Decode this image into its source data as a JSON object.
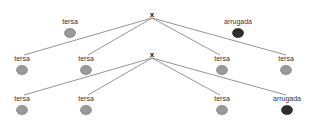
{
  "diagram": {
    "type": "genetic-cross-tree",
    "colors": {
      "smooth_pea": "#9a9a9a",
      "smooth_pea_stroke": "#6e6e6e",
      "wrinkled_pea": "#2e2e2e",
      "wrinkled_pea_stroke": "#111111",
      "line": "#7a7a7a"
    },
    "cross_symbol": "x",
    "parents": [
      {
        "label": "tersa",
        "phenotype": "smooth"
      },
      {
        "label": "arrugada",
        "phenotype": "wrinkled"
      }
    ],
    "f1": [
      {
        "label": "tersa",
        "phenotype": "smooth"
      },
      {
        "label": "tersa",
        "phenotype": "smooth"
      },
      {
        "label": "tersa",
        "phenotype": "smooth"
      },
      {
        "label": "tersa",
        "phenotype": "smooth"
      }
    ],
    "f1_cross_symbol": "x",
    "f2": [
      {
        "label": "tersa",
        "phenotype": "smooth"
      },
      {
        "label": "tersa",
        "phenotype": "smooth"
      },
      {
        "label": "tersa",
        "phenotype": "smooth"
      },
      {
        "label": "arrugada",
        "phenotype": "wrinkled"
      }
    ]
  }
}
